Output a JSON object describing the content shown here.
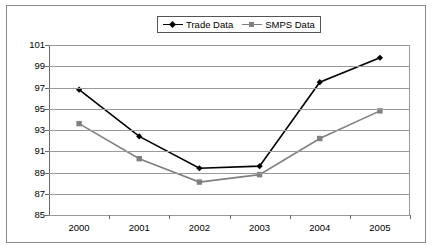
{
  "chart_data": {
    "type": "line",
    "title": "",
    "xlabel": "",
    "ylabel": "",
    "categories": [
      "2000",
      "2001",
      "2002",
      "2003",
      "2004",
      "2005"
    ],
    "yticks": [
      101,
      99,
      97,
      95,
      93,
      91,
      89,
      87,
      85
    ],
    "ylim": [
      85,
      101
    ],
    "grid": true,
    "legend_position": "top-center",
    "series": [
      {
        "name": "Trade Data",
        "color": "#000000",
        "marker": "diamond",
        "values": [
          96.8,
          92.4,
          89.4,
          89.6,
          97.5,
          99.8
        ]
      },
      {
        "name": "SMPS Data",
        "color": "#808080",
        "marker": "square",
        "values": [
          93.6,
          90.3,
          88.1,
          88.8,
          92.2,
          94.8
        ]
      }
    ]
  },
  "legend": {
    "items": [
      {
        "label": "Trade Data"
      },
      {
        "label": "SMPS Data"
      }
    ]
  },
  "colors": {
    "trade": "#000000",
    "smps": "#808080",
    "grid": "#9a9a9a",
    "axis": "#6b6b6b",
    "frame": "#8a8a8a"
  }
}
